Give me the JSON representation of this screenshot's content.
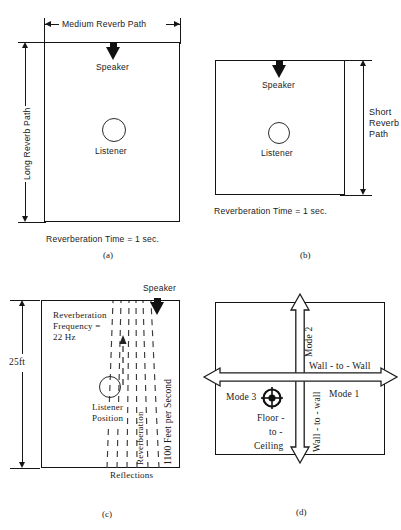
{
  "figure": {
    "panels": [
      {
        "id": "a",
        "caption": "(a)",
        "top_dimension_label": "Medium  Reverb  Path",
        "left_dimension_label": "Long  Reverb  Path",
        "speaker_label": "Speaker",
        "listener_label": "Listener",
        "bottom_note": "Reverberation Time = 1 sec."
      },
      {
        "id": "b",
        "caption": "(b)",
        "right_dimension_label_line1": "Short",
        "right_dimension_label_line2": "Reverb",
        "right_dimension_label_line3": "Path",
        "speaker_label": "Speaker",
        "listener_label": "Listener",
        "bottom_note": "Reverberation  Time = 1 sec."
      },
      {
        "id": "c",
        "caption": "(c)",
        "height_dimension_label": "25ft",
        "speaker_label": "Speaker",
        "note_line1": "Reverberation",
        "note_line2": "Frequency  =",
        "note_line3": "22 Hz",
        "listener_label_line1": "Listener",
        "listener_label_line2": "Position",
        "reverberation_label": "Reverberation",
        "speed_label": "1100  Feet  per  Second",
        "reflections_label": "Reflections"
      },
      {
        "id": "d",
        "caption": "(d)",
        "mode1_label": "Mode  1",
        "mode1_axis_label": "Wall - to - Wall",
        "mode2_label": "Mode  2",
        "mode2_axis_label": "Wall - to - wall",
        "mode3_label": "Mode  3",
        "mode3_axis_line1": "Floor -",
        "mode3_axis_line2": "to -",
        "mode3_axis_line3": "Ceiling"
      }
    ]
  },
  "colors": {
    "ink": "#141414",
    "speaker_fill": "#111111",
    "paper": "#ffffff",
    "ray": "#3a3a3a"
  }
}
